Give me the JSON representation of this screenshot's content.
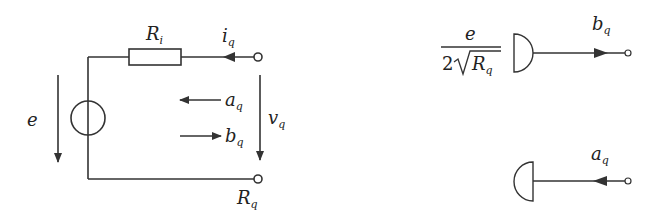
{
  "diagram": {
    "colors": {
      "stroke": "#333333",
      "background": "#ffffff"
    },
    "left_circuit": {
      "labels": {
        "resistor": {
          "base": "R",
          "sub": "i"
        },
        "current": {
          "base": "i",
          "sub": "q"
        },
        "source_voltage": {
          "base": "e"
        },
        "incident_wave": {
          "base": "a",
          "sub": "q"
        },
        "reflected_wave": {
          "base": "b",
          "sub": "q"
        },
        "port_voltage": {
          "base": "v",
          "sub": "q"
        },
        "port_resistance": {
          "base": "R",
          "sub": "q"
        }
      }
    },
    "right_diagram": {
      "source_fraction": {
        "numerator": "e",
        "denominator_coef": "2",
        "denominator_sqrt_base": "R",
        "denominator_sqrt_sub": "q"
      },
      "top_output": {
        "base": "b",
        "sub": "q"
      },
      "bottom_input": {
        "base": "a",
        "sub": "q"
      }
    }
  }
}
